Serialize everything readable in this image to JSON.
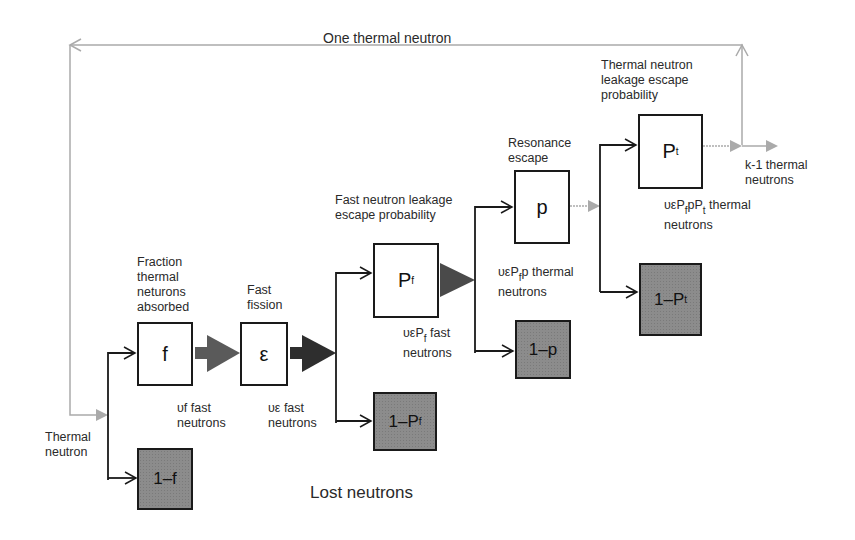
{
  "loop": {
    "label": "One thermal neutron",
    "color": "#aaaaaa"
  },
  "input": {
    "label_line1": "Thermal",
    "label_line2": "neutron"
  },
  "stages": [
    {
      "id": "f",
      "symbol": "f",
      "desc": [
        "Fraction",
        "thermal",
        "neturons",
        "absorbed"
      ],
      "output": [
        "υf fast",
        "neutrons"
      ],
      "lost": "1–f"
    },
    {
      "id": "epsilon",
      "symbol": "ε",
      "desc": [
        "Fast",
        "fission"
      ],
      "output": [
        "υε fast",
        "neutrons"
      ]
    },
    {
      "id": "Pf",
      "symbol": "P",
      "symbol_sub": "f",
      "desc": [
        "Fast neutron leakage",
        "escape probability"
      ],
      "output": [
        "υεP",
        "f",
        " fast",
        "neutrons"
      ],
      "lost": "1–P",
      "lost_sub": "f"
    },
    {
      "id": "p",
      "symbol": "p",
      "desc": [
        "Resonance",
        "escape"
      ],
      "output": [
        "υεP",
        "f",
        "p thermal",
        "neutrons"
      ],
      "lost": "1–p"
    },
    {
      "id": "Pt",
      "symbol": "P",
      "symbol_sub": "t",
      "desc": [
        "Thermal neutron",
        "leakage escape",
        "probability"
      ],
      "output": [
        "υεP",
        "f",
        "pP",
        "t",
        " thermal",
        "neutrons"
      ],
      "lost": "1–P",
      "lost_sub": "t"
    }
  ],
  "result": {
    "line1": "k-1 thermal",
    "line2": "neutrons"
  },
  "lost_label": "Lost neutrons",
  "colors": {
    "box_border": "#1a1a1a",
    "lost_fill": "#8c8c8c",
    "fast_arrow": "#555555",
    "thermal_arrow": "#aaaaaa"
  }
}
